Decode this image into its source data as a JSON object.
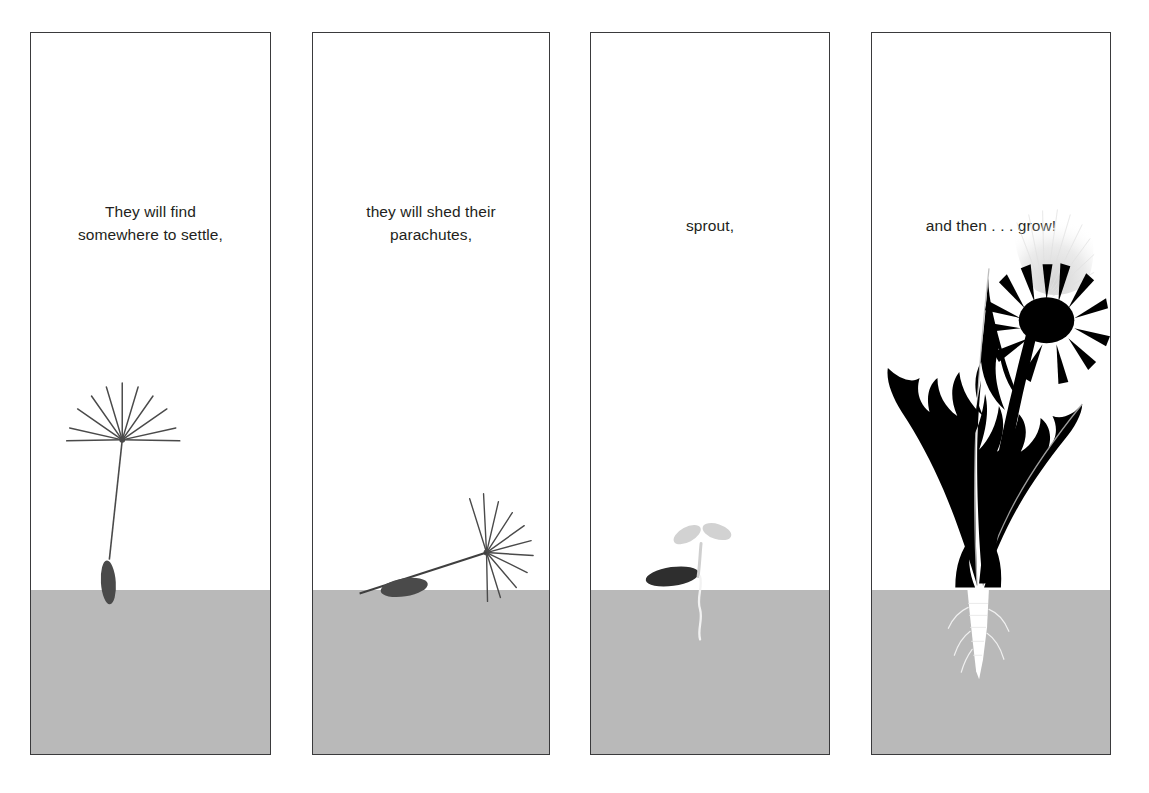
{
  "page": {
    "background_color": "#ffffff",
    "width": 1149,
    "height": 793
  },
  "style": {
    "panel_border_color": "#3a3a3c",
    "ground_color": "#b9b9b9",
    "text_color": "#231f20",
    "silhouette_color": "#000000",
    "seed_gray": "#4a4a4a",
    "pappus_light": "#e3e3e3",
    "root_white": "#ffffff",
    "sprout_gray": "#cfcfcf"
  },
  "panels": [
    {
      "id": "panel-1",
      "index": 1,
      "caption_line_1": "They will find",
      "caption_line_2": "somewhere to settle,",
      "caption_full": "They will find somewhere to settle,",
      "art_name": "floating-dandelion-seed",
      "art_description": "A single dandelion seed with open pappus parachute drifting above the ground",
      "x": 30,
      "y": 32,
      "width": 241,
      "height": 723,
      "ground_top_offset": 559
    },
    {
      "id": "panel-2",
      "index": 2,
      "caption_line_1": "they will shed their",
      "caption_line_2": "parachutes,",
      "caption_full": "they will shed their parachutes,",
      "art_name": "landed-dandelion-seed",
      "art_description": "A dandelion seed lying at an angle on the ground, parachute tipped sideways",
      "x": 312,
      "y": 32,
      "width": 238,
      "height": 723,
      "ground_top_offset": 559
    },
    {
      "id": "panel-3",
      "index": 3,
      "caption_line_1": "sprout,",
      "caption_line_2": "",
      "caption_full": "sprout,",
      "art_name": "dandelion-sprout",
      "art_description": "A tiny seedling with two pale cotyledons, dark seed husk and a thin root into the soil",
      "x": 590,
      "y": 32,
      "width": 240,
      "height": 723,
      "ground_top_offset": 559
    },
    {
      "id": "panel-4",
      "index": 4,
      "caption_line_1": "and then . . . grow!",
      "caption_line_2": "",
      "caption_full": "and then . . . grow!",
      "art_name": "mature-dandelion-plant",
      "art_description": "A full dandelion silhouette with two toothed leaves, a seed head with pappus, and a white taproot below the soil line",
      "x": 871,
      "y": 32,
      "width": 240,
      "height": 723,
      "ground_top_offset": 559
    }
  ]
}
